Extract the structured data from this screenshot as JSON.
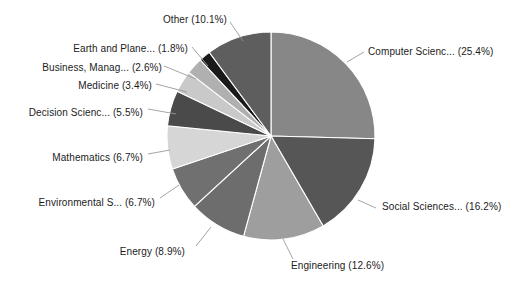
{
  "chart_data": {
    "type": "pie",
    "title": "",
    "subtitle": "",
    "xlabel": "",
    "ylabel": "",
    "legend_position": "none",
    "grid": false,
    "labels_show_percent": true,
    "start_angle_deg": 0,
    "direction": "clockwise",
    "categories": [
      "Computer Scienc...",
      "Social Sciences...",
      "Engineering",
      "Energy",
      "Environmental S...",
      "Mathematics",
      "Decision Scienc...",
      "Medicine",
      "Business, Manag...",
      "Earth and Plane...",
      "Other"
    ],
    "values": [
      25.4,
      16.2,
      12.6,
      8.9,
      6.7,
      6.7,
      5.5,
      3.4,
      2.6,
      1.8,
      10.1
    ],
    "colors": [
      "#878787",
      "#565656",
      "#9e9e9e",
      "#6d6d6d",
      "#707070",
      "#d6d6d6",
      "#4a4a4a",
      "#c9c9c9",
      "#b0b0b0",
      "#1a1a1a",
      "#5e5e5e"
    ],
    "slices": [
      {
        "label": "Computer Scienc...",
        "percent": 25.4,
        "text": "Computer Scienc... (25.4%)",
        "color": "#878787"
      },
      {
        "label": "Social Sciences...",
        "percent": 16.2,
        "text": "Social Sciences... (16.2%)",
        "color": "#565656"
      },
      {
        "label": "Engineering",
        "percent": 12.6,
        "text": "Engineering (12.6%)",
        "color": "#9e9e9e"
      },
      {
        "label": "Energy",
        "percent": 8.9,
        "text": "Energy (8.9%)",
        "color": "#6d6d6d"
      },
      {
        "label": "Environmental S...",
        "percent": 6.7,
        "text": "Environmental S... (6.7%)",
        "color": "#707070"
      },
      {
        "label": "Mathematics",
        "percent": 6.7,
        "text": "Mathematics (6.7%)",
        "color": "#d6d6d6"
      },
      {
        "label": "Decision Scienc...",
        "percent": 5.5,
        "text": "Decision Scienc... (5.5%)",
        "color": "#4a4a4a"
      },
      {
        "label": "Medicine",
        "percent": 3.4,
        "text": "Medicine (3.4%)",
        "color": "#c9c9c9"
      },
      {
        "label": "Business, Manag...",
        "percent": 2.6,
        "text": "Business, Manag... (2.6%)",
        "color": "#b0b0b0"
      },
      {
        "label": "Earth and Plane...",
        "percent": 1.8,
        "text": "Earth and Plane... (1.8%)",
        "color": "#1a1a1a"
      },
      {
        "label": "Other",
        "percent": 10.1,
        "text": "Other (10.1%)",
        "color": "#5e5e5e"
      }
    ],
    "background_color": "#ffffff",
    "label_text_color": "#1c1c1c",
    "leader_line_color": "#9a9a9a"
  },
  "labels": {
    "computer_science": "Computer Scienc... (25.4%)",
    "social_sciences": "Social Sciences... (16.2%)",
    "engineering": "Engineering (12.6%)",
    "energy": "Energy (8.9%)",
    "environmental": "Environmental S... (6.7%)",
    "mathematics": "Mathematics (6.7%)",
    "decision_sciences": "Decision Scienc... (5.5%)",
    "medicine": "Medicine (3.4%)",
    "business": "Business, Manag... (2.6%)",
    "earth_planetary": "Earth and Plane... (1.8%)",
    "other": "Other (10.1%)"
  }
}
